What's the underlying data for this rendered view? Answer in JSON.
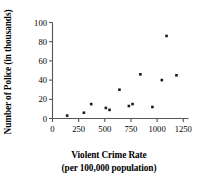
{
  "chart_data": {
    "type": "scatter",
    "title": "",
    "xlabel": "Violent Crime Rate",
    "xlabel_line2": "(per 100,000 population)",
    "ylabel": "Number of Police (in thousands)",
    "xlim": [
      0,
      1300
    ],
    "ylim": [
      0,
      100
    ],
    "xticks": [
      0,
      250,
      500,
      750,
      1000,
      1250
    ],
    "xtick_labels": [
      "0",
      "250",
      "500",
      "750",
      "1000",
      "1250"
    ],
    "yticks": [
      0,
      20,
      40,
      60,
      80,
      100
    ],
    "ytick_labels": [
      "0",
      "20",
      "40",
      "60",
      "80",
      "100"
    ],
    "grid": false,
    "legend": false,
    "marker": "square",
    "marker_color": "#1a1a1a",
    "points": [
      {
        "x": 140,
        "y": 3
      },
      {
        "x": 300,
        "y": 6
      },
      {
        "x": 370,
        "y": 15
      },
      {
        "x": 510,
        "y": 11
      },
      {
        "x": 545,
        "y": 9
      },
      {
        "x": 640,
        "y": 30
      },
      {
        "x": 730,
        "y": 13
      },
      {
        "x": 765,
        "y": 15
      },
      {
        "x": 840,
        "y": 46
      },
      {
        "x": 955,
        "y": 12
      },
      {
        "x": 1045,
        "y": 40
      },
      {
        "x": 1090,
        "y": 86
      },
      {
        "x": 1185,
        "y": 45
      }
    ]
  },
  "axis": {
    "line_color": "#555555"
  }
}
